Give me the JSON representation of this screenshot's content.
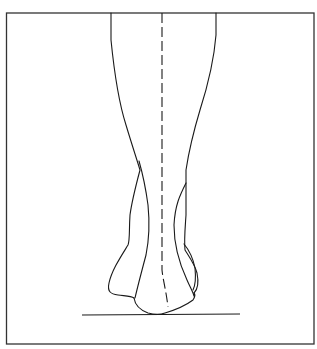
{
  "figure": {
    "colors": {
      "background": "#ffffff",
      "line": "#1a1a1a",
      "frame": "#333333"
    },
    "elements": [
      "frame-border",
      "leg-outline-left",
      "leg-outline-right",
      "achilles-tendon-lines",
      "heel-outline",
      "vertical-dashed-axis",
      "ground-line"
    ]
  }
}
